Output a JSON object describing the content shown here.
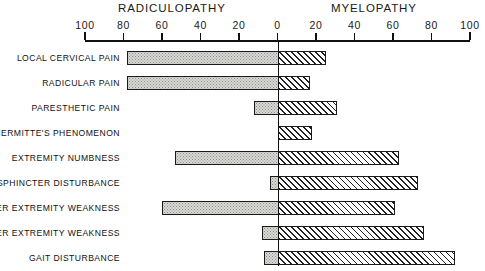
{
  "chart_data": {
    "type": "bar",
    "orientation": "horizontal",
    "style": "diverging-bidirectional",
    "title": "",
    "xlabel": "",
    "ylabel": "",
    "grid": false,
    "legend_position": "top",
    "axis": {
      "left_title": "RADICULOPATHY",
      "right_title": "MYELOPATHY",
      "tick_labels": [
        "100",
        "80",
        "60",
        "40",
        "20",
        "0",
        "20",
        "40",
        "60",
        "80",
        "100"
      ],
      "tick_values": [
        -100,
        -80,
        -60,
        -40,
        -20,
        0,
        20,
        40,
        60,
        80,
        100
      ],
      "xlim": [
        -100,
        100
      ],
      "center_value": 0,
      "units": "percent"
    },
    "categories": [
      "LOCAL CERVICAL PAIN",
      "RADICULAR PAIN",
      "PARESTHETIC PAIN",
      "LHERMITTE'S PHENOMENON",
      "EXTREMITY NUMBNESS",
      "SPHINCTER DISTURBANCE",
      "UPPER EXTREMITY WEAKNESS",
      "LOWER EXTREMITY WEAKNESS",
      "GAIT DISTURBANCE"
    ],
    "series": [
      {
        "name": "RADICULOPATHY",
        "direction": "left",
        "fill": "stipple",
        "values": [
          78,
          78,
          12,
          0,
          53,
          4,
          60,
          8,
          7
        ]
      },
      {
        "name": "MYELOPATHY",
        "direction": "right",
        "fill": "hatch",
        "values": [
          25,
          17,
          31,
          18,
          63,
          73,
          61,
          76,
          92
        ]
      }
    ],
    "colors": {
      "axis": "#111111",
      "left_fill": "#d9d9d6",
      "right_fill": "#ffffff",
      "outline": "#1a1a1a"
    }
  }
}
